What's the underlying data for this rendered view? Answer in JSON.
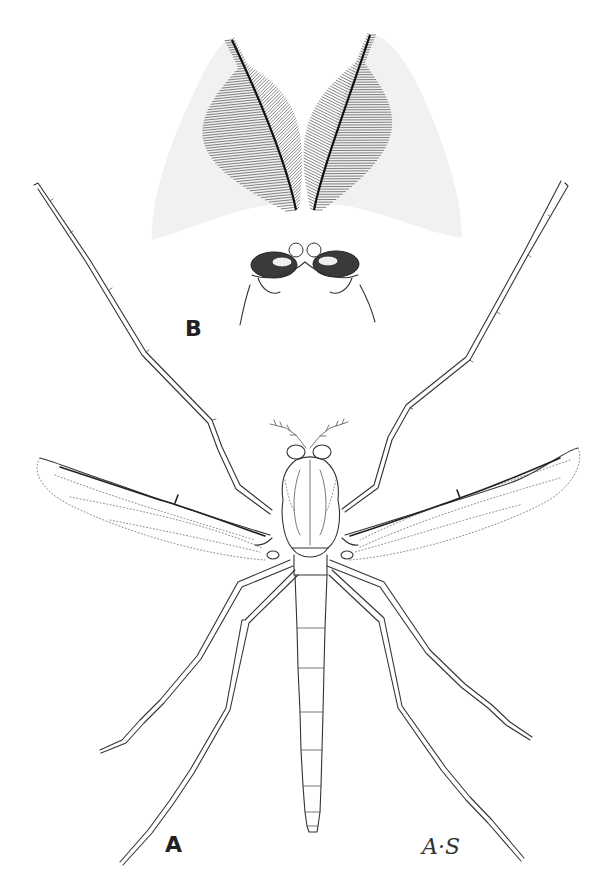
{
  "figure": {
    "type": "scientific line illustration",
    "panels": [
      {
        "id": "A",
        "label": "A",
        "description": "whole insect, dorsal view, wings spread"
      },
      {
        "id": "B",
        "label": "B",
        "description": "head with plumose (feathery) antennae"
      }
    ],
    "signature": "A·S",
    "colors": {
      "background": "#ffffff",
      "ink": "#333333"
    }
  }
}
